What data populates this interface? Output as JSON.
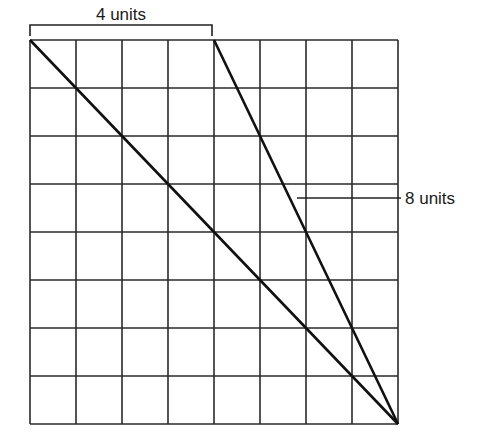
{
  "diagram": {
    "type": "grid-with-diagonals",
    "grid": {
      "columns": 8,
      "rows": 8,
      "left": 30,
      "top": 40,
      "cell_width": 46,
      "cell_height": 48
    },
    "top_bracket": {
      "label": "4 units",
      "spans_columns": 4
    },
    "side_callout": {
      "label": "8 units"
    },
    "lines": [
      {
        "name": "long-diagonal",
        "from": "top-left corner",
        "to": "bottom-right corner"
      },
      {
        "name": "short-diagonal",
        "from": "top edge at column 4",
        "to": "bottom-right corner"
      }
    ],
    "colors": {
      "grid": "#2a2a2a",
      "diagonal": "#111111",
      "background": "#ffffff"
    }
  }
}
